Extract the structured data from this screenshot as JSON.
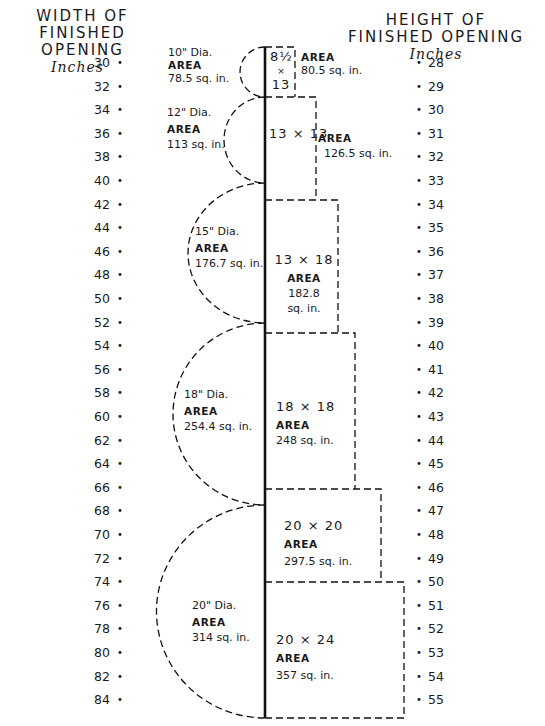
{
  "header": {
    "left": {
      "line1": "WIDTH  OF",
      "line2": "FINISHED  OPENING",
      "unit": "Inches"
    },
    "right": {
      "line1": "HEIGHT  OF",
      "line2": "FINISHED  OPENING",
      "unit": "Inches"
    }
  },
  "axes": {
    "width_ticks": [
      "30",
      "32",
      "34",
      "36",
      "38",
      "40",
      "42",
      "44",
      "46",
      "48",
      "50",
      "52",
      "54",
      "56",
      "58",
      "60",
      "62",
      "64",
      "66",
      "68",
      "70",
      "72",
      "74",
      "76",
      "78",
      "80",
      "82",
      "84"
    ],
    "height_ticks": [
      "28",
      "29",
      "30",
      "31",
      "32",
      "33",
      "34",
      "35",
      "36",
      "37",
      "38",
      "39",
      "40",
      "41",
      "42",
      "43",
      "44",
      "45",
      "46",
      "47",
      "48",
      "49",
      "50",
      "51",
      "52",
      "53",
      "54",
      "55"
    ]
  },
  "circles": [
    {
      "dia": "10\" Dia.",
      "area_label": "AREA",
      "area": "78.5 sq. in."
    },
    {
      "dia": "12\" Dia.",
      "area_label": "AREA",
      "area": "113 sq. in."
    },
    {
      "dia": "15\" Dia.",
      "area_label": "AREA",
      "area": "176.7 sq. in."
    },
    {
      "dia": "18\" Dia.",
      "area_label": "AREA",
      "area": "254.4 sq. in."
    },
    {
      "dia": "20\" Dia.",
      "area_label": "AREA",
      "area": "314 sq. in."
    }
  ],
  "rects": [
    {
      "w": "8½",
      "x": "×",
      "h": "13",
      "area_label": "AREA",
      "area": "80.5 sq. in."
    },
    {
      "dims": "13 × 13",
      "area_label": "AREA",
      "area": "126.5 sq. in."
    },
    {
      "dims": "13  ×  18",
      "area_label": "AREA",
      "area_line1": "182.8",
      "area_line2": "sq. in."
    },
    {
      "dims": "18  ×  18",
      "area_label": "AREA",
      "area": "248 sq. in."
    },
    {
      "dims": "20  ×  20",
      "area_label": "AREA",
      "area": "297.5 sq. in."
    },
    {
      "dims": "20  ×  24",
      "area_label": "AREA",
      "area": "357 sq. in."
    }
  ],
  "chart_data": {
    "type": "diagram",
    "left_axis": {
      "label": "WIDTH OF FINISHED OPENING (Inches)",
      "range": [
        30,
        84
      ],
      "step": 2
    },
    "right_axis": {
      "label": "HEIGHT OF FINISHED OPENING (Inches)",
      "range": [
        28,
        55
      ],
      "step": 1
    },
    "round_flues": [
      {
        "diameter_in": 10,
        "area_sq_in": 78.5
      },
      {
        "diameter_in": 12,
        "area_sq_in": 113
      },
      {
        "diameter_in": 15,
        "area_sq_in": 176.7
      },
      {
        "diameter_in": 18,
        "area_sq_in": 254.4
      },
      {
        "diameter_in": 20,
        "area_sq_in": 314
      }
    ],
    "rectangular_flues": [
      {
        "size": "8.5 x 13",
        "area_sq_in": 80.5
      },
      {
        "size": "13 x 13",
        "area_sq_in": 126.5
      },
      {
        "size": "13 x 18",
        "area_sq_in": 182.8
      },
      {
        "size": "18 x 18",
        "area_sq_in": 248
      },
      {
        "size": "20 x 20",
        "area_sq_in": 297.5
      },
      {
        "size": "20 x 24",
        "area_sq_in": 357
      }
    ]
  }
}
